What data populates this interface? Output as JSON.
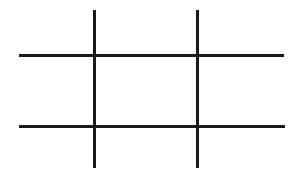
{
  "figure": {
    "title": "Tic-Tac-Toe Grid",
    "canvas": {
      "width": 293,
      "height": 175,
      "background_color": "#ffffff"
    },
    "style": {
      "line_color": "#1a1a1a",
      "line_width": 3,
      "line_cap": "butt"
    },
    "lines": [
      {
        "id": "vertical-line-left",
        "orientation": "vertical",
        "x1": 94.5,
        "y1": 10,
        "x2": 94.5,
        "y2": 168,
        "color": "#1a1a1a",
        "width": 3
      },
      {
        "id": "vertical-line-right",
        "orientation": "vertical",
        "x1": 197.5,
        "y1": 10,
        "x2": 197.5,
        "y2": 168,
        "color": "#1a1a1a",
        "width": 3
      },
      {
        "id": "horizontal-line-top",
        "orientation": "horizontal",
        "x1": 19,
        "y1": 55.5,
        "x2": 284,
        "y2": 55.5,
        "color": "#1a1a1a",
        "width": 3
      },
      {
        "id": "horizontal-line-bottom",
        "orientation": "horizontal",
        "x1": 19,
        "y1": 126.5,
        "x2": 285,
        "y2": 126.5,
        "color": "#1a1a1a",
        "width": 3
      }
    ],
    "intersections": [
      {
        "id": "intersection-top-left",
        "x": 94.5,
        "y": 55.5
      },
      {
        "id": "intersection-top-right",
        "x": 197.5,
        "y": 55.5
      },
      {
        "id": "intersection-bottom-left",
        "x": 94.5,
        "y": 126.5
      },
      {
        "id": "intersection-bottom-right",
        "x": 197.5,
        "y": 126.5
      }
    ],
    "cells": [
      {
        "id": "cell-1",
        "row": 0,
        "col": 0,
        "mark": "",
        "x": 19,
        "y": 10,
        "width": 74,
        "height": 44
      },
      {
        "id": "cell-2",
        "row": 0,
        "col": 1,
        "mark": "",
        "x": 96,
        "y": 10,
        "width": 100,
        "height": 44
      },
      {
        "id": "cell-3",
        "row": 0,
        "col": 2,
        "mark": "",
        "x": 199,
        "y": 10,
        "width": 85,
        "height": 44
      },
      {
        "id": "cell-4",
        "row": 1,
        "col": 0,
        "mark": "",
        "x": 19,
        "y": 57,
        "width": 74,
        "height": 68
      },
      {
        "id": "cell-5",
        "row": 1,
        "col": 1,
        "mark": "",
        "x": 96,
        "y": 57,
        "width": 100,
        "height": 68
      },
      {
        "id": "cell-6",
        "row": 1,
        "col": 2,
        "mark": "",
        "x": 199,
        "y": 57,
        "width": 85,
        "height": 68
      },
      {
        "id": "cell-7",
        "row": 2,
        "col": 0,
        "mark": "",
        "x": 19,
        "y": 128,
        "width": 74,
        "height": 40
      },
      {
        "id": "cell-8",
        "row": 2,
        "col": 1,
        "mark": "",
        "x": 96,
        "y": 128,
        "width": 100,
        "height": 40
      },
      {
        "id": "cell-9",
        "row": 2,
        "col": 2,
        "mark": "",
        "x": 199,
        "y": 128,
        "width": 85,
        "height": 40
      }
    ]
  }
}
